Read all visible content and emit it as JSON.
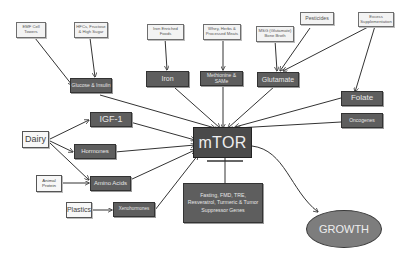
{
  "diagram": {
    "center": "mTOR",
    "outcome": "GROWTH",
    "inhibitor_box": "Fasting, FMD, TRE, Resveratrol, Turmeric & Tumor Suppressor Genes",
    "top_sources": {
      "emf": "EMF Cell Towers",
      "hfcs": "HFCs, Fructose & High Sugar",
      "iron_foods": "Iron Enriched Foods",
      "meat": "Whey, Herbs & Processed Meats",
      "msg": "MSG (Glutamate) Bone Broth",
      "pesticides": "Pesticides",
      "folic": "Excess Supplementation"
    },
    "mediators": {
      "glucose_insulin": "Glucose & Insulin",
      "iron": "Iron",
      "methionine": "Methionine & SAMe",
      "glutamate": "Glutamate",
      "folate": "Folate",
      "oncogenes": "Oncogenes",
      "igf1": "IGF-1",
      "hormones": "Hormones",
      "amino_acids": "Amino Acids",
      "xenohormones": "Xenohormones"
    },
    "left_sources": {
      "dairy": "Dairy",
      "animal_protein": "Animal Protein",
      "plastics": "Plastics"
    }
  },
  "colors": {
    "dark_box": "#5e5e5e",
    "mtor_box": "#4a4a4a",
    "growth_ellipse": "#7d7d7d",
    "light_box": "#f3f3f3",
    "edge": "#333333"
  }
}
